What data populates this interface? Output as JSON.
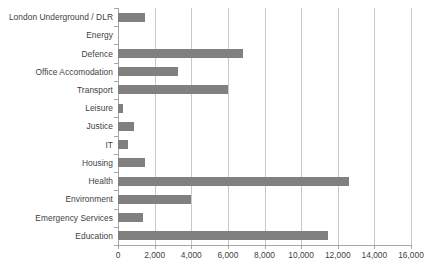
{
  "chart_data": {
    "type": "bar",
    "orientation": "horizontal",
    "title": "",
    "subtitle": "",
    "xlabel": "",
    "ylabel": "",
    "xlim": [
      0,
      16000
    ],
    "xticks": [
      0,
      2000,
      4000,
      6000,
      8000,
      10000,
      12000,
      14000,
      16000
    ],
    "xtick_labels": [
      "0",
      "2,000",
      "4,000",
      "6,000",
      "8,000",
      "10,000",
      "12,000",
      "14,000",
      "16,000"
    ],
    "grid": "vertical",
    "legend": "none",
    "bar_color": "#808080",
    "gridline_color": "#c8c8c8",
    "axis_color": "#a6a6a6",
    "label_color": "#3f3f3f",
    "categories": [
      "London Underground / DLR",
      "Energy",
      "Defence",
      "Office Accomodation",
      "Transport",
      "Leisure",
      "Justice",
      "IT",
      "Housing",
      "Health",
      "Environment",
      "Emergency Services",
      "Education"
    ],
    "values": [
      1450,
      0,
      6800,
      3250,
      6000,
      250,
      850,
      550,
      1450,
      12600,
      4000,
      1350,
      11450
    ]
  }
}
